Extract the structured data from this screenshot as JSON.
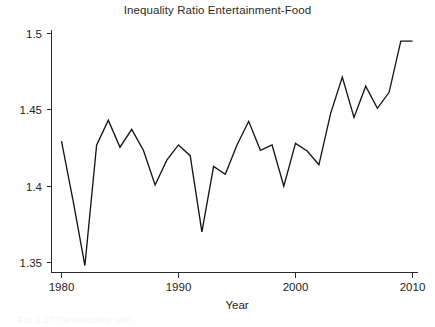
{
  "figure": {
    "title": "Inequality Ratio Entertainment-Food",
    "xlabel": "Year",
    "ylabel": "",
    "caption_partial": "Fig. 1.17 The inequality ratio ..."
  },
  "axes": {
    "y_ticks": [
      "1.5",
      "1.45",
      "1.4",
      "1.35"
    ],
    "x_ticks": [
      "1980",
      "1990",
      "2000",
      "2010"
    ]
  },
  "colors": {
    "line": "#161616",
    "axis": "#2a2a2a",
    "background": "#ffffff",
    "text": "#232323"
  },
  "chart_data": {
    "type": "line",
    "title": "Inequality Ratio Entertainment-Food",
    "xlabel": "Year",
    "ylabel": "",
    "xlim": [
      1980,
      2010
    ],
    "ylim": [
      1.335,
      1.5
    ],
    "grid": false,
    "legend": null,
    "x": [
      1980,
      1981,
      1982,
      1983,
      1984,
      1985,
      1986,
      1987,
      1988,
      1989,
      1990,
      1991,
      1992,
      1993,
      1994,
      1995,
      1996,
      1997,
      1998,
      1999,
      2000,
      2001,
      2002,
      2003,
      2004,
      2005,
      2006,
      2007,
      2008,
      2009,
      2010
    ],
    "values": [
      1.4295,
      1.39,
      1.348,
      1.4268,
      1.4432,
      1.4255,
      1.4372,
      1.4235,
      1.4008,
      1.417,
      1.427,
      1.42,
      1.37,
      1.413,
      1.4078,
      1.427,
      1.4425,
      1.4235,
      1.427,
      1.4,
      1.428,
      1.423,
      1.414,
      1.4475,
      1.4715,
      1.445,
      1.4655,
      1.451,
      1.4615,
      1.495,
      1.495
    ],
    "y_tick_values": [
      1.5,
      1.45,
      1.4,
      1.35
    ],
    "x_tick_values": [
      1980,
      1990,
      2000,
      2010
    ]
  }
}
